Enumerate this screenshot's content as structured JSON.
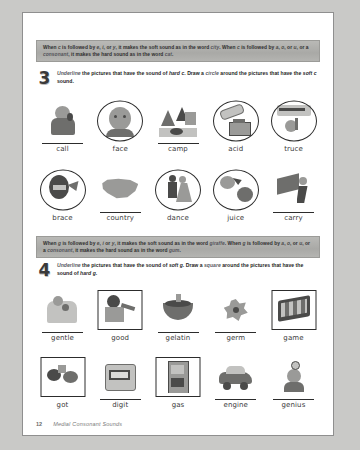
{
  "page": {
    "footer_page_number": "12",
    "footer_title": "Medial Consonant Sounds"
  },
  "rule_c": {
    "line1_a": "When ",
    "line1_c": "c",
    "line1_b": " is followed by ",
    "line1_e": "e",
    "line1_comma1": ", ",
    "line1_i": "i",
    "line1_or": ", or ",
    "line1_y": "y",
    "line1_c2": ", it makes the soft sound as in the word ",
    "line1_word": "city",
    "line1_d": ". When ",
    "line1_c3": "c",
    "line1_e2": " is",
    "line2_a": "followed by ",
    "line2_va": "a",
    "line2_comma1": ", ",
    "line2_vo": "o",
    "line2_or": ", or ",
    "line2_vu": "u",
    "line2_b": ", or a ",
    "line2_cons": "consonant",
    "line2_c": ", it makes the hard sound as in the word ",
    "line2_word": "cat",
    "line2_end": "."
  },
  "rule_g": {
    "line1_a": "When ",
    "line1_g": "g",
    "line1_b": " is followed by ",
    "line1_e": "e",
    "line1_comma1": ", ",
    "line1_i": "i",
    "line1_or": " or ",
    "line1_y": "y",
    "line1_c2": ", it makes the soft sound as in the word ",
    "line1_word": "giraffe",
    "line1_d": ". When ",
    "line1_g2": "g",
    "line1_e2": " is",
    "line2_a": "followed by ",
    "line2_va": "a",
    "line2_comma1": ", ",
    "line2_vo": "o",
    "line2_or": ", or ",
    "line2_vu": "u",
    "line2_b": ", or a ",
    "line2_cons": "consonant",
    "line2_c": ", it makes the hard sound as in the word ",
    "line2_word": "gum",
    "line2_end": "."
  },
  "activity3": {
    "number": "3",
    "t1": "Underline",
    "t2": " the pictures that have the sound of ",
    "t3": "hard c",
    "t4": ". Draw a ",
    "t5": "circle",
    "t6": " around the pictures that have the ",
    "t7": "soft c",
    "t8": " sound."
  },
  "activity4": {
    "number": "4",
    "t1": "Underline",
    "t2": " the pictures that have the sound of ",
    "t3": "soft g",
    "t4": ". Draw a ",
    "t5": "square",
    "t6": " around the pictures that have the sound of ",
    "t7": "hard g",
    "t8": "."
  },
  "rows": [
    {
      "id": "row-c-1",
      "items": [
        {
          "label": "call",
          "mark": "none",
          "underline": true,
          "art": "woman-calling"
        },
        {
          "label": "face",
          "mark": "circle",
          "underline": false,
          "art": "baby-face"
        },
        {
          "label": "camp",
          "mark": "none",
          "underline": true,
          "art": "campsite"
        },
        {
          "label": "acid",
          "mark": "circle",
          "underline": false,
          "art": "acid-beaker"
        },
        {
          "label": "truce",
          "mark": "circle",
          "underline": false,
          "art": "truce-sign"
        }
      ]
    },
    {
      "id": "row-c-2",
      "items": [
        {
          "label": "brace",
          "mark": "circle",
          "underline": false,
          "art": "brace-teeth"
        },
        {
          "label": "country",
          "mark": "none",
          "underline": true,
          "art": "usa-map"
        },
        {
          "label": "dance",
          "mark": "circle",
          "underline": false,
          "art": "dancing-couple"
        },
        {
          "label": "juice",
          "mark": "circle",
          "underline": false,
          "art": "juice-fruit"
        },
        {
          "label": "carry",
          "mark": "none",
          "underline": true,
          "art": "man-carrying"
        }
      ]
    },
    {
      "id": "row-g-1",
      "items": [
        {
          "label": "gentle",
          "mark": "none",
          "underline": true,
          "art": "mother-child"
        },
        {
          "label": "good",
          "mark": "square",
          "underline": false,
          "art": "boy-eating"
        },
        {
          "label": "gelatin",
          "mark": "none",
          "underline": true,
          "art": "gelatin-bowl"
        },
        {
          "label": "germ",
          "mark": "none",
          "underline": true,
          "art": "germ-blob"
        },
        {
          "label": "game",
          "mark": "square",
          "underline": false,
          "art": "game-board"
        }
      ]
    },
    {
      "id": "row-g-2",
      "items": [
        {
          "label": "got",
          "mark": "square",
          "underline": false,
          "art": "got-hands"
        },
        {
          "label": "digit",
          "mark": "none",
          "underline": true,
          "art": "digit-display"
        },
        {
          "label": "gas",
          "mark": "square",
          "underline": false,
          "art": "gas-pump"
        },
        {
          "label": "engine",
          "mark": "none",
          "underline": true,
          "art": "car-engine"
        },
        {
          "label": "genius",
          "mark": "none",
          "underline": true,
          "art": "genius-person"
        }
      ]
    }
  ]
}
